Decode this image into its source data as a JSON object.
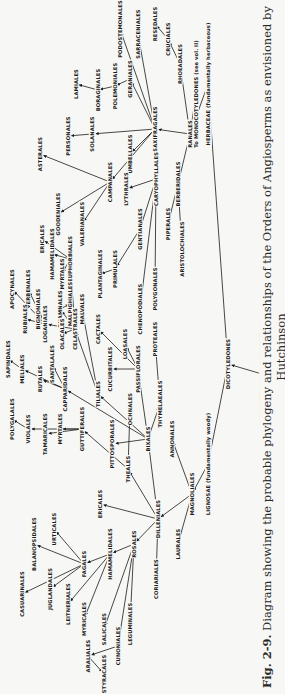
{
  "figure": {
    "number": "Fig. 2-9.",
    "caption": "Diagram showing the probable phylogeny and relationships of the Orders of Angiosperms as envisioned by Hutchinson"
  },
  "nodes": [
    {
      "id": "hypothetical_proangiosperms",
      "label": "HYPOTHETICAL PROANGIOSPERMS",
      "x": 320,
      "y": 262
    },
    {
      "id": "dicotyledones",
      "label": "DICOTYLEDONES",
      "x": 330,
      "y": 228
    },
    {
      "id": "herbaceae",
      "label": "HERBACEAE (fundamentally herbaceous)",
      "x": 610,
      "y": 208
    },
    {
      "id": "lignosae",
      "label": "LIGNOSAE (fundamentally woody)",
      "x": 230,
      "y": 208
    },
    {
      "id": "monocotyledones",
      "label": "To MONOCOTYLEDONES (see vol. II)",
      "x": 600,
      "y": 196
    },
    {
      "id": "ranales",
      "label": "RANALES",
      "x": 560,
      "y": 190
    },
    {
      "id": "rhoeadales",
      "label": "RHOEADALES",
      "x": 630,
      "y": 180
    },
    {
      "id": "cruciales",
      "label": "CRUCIALES",
      "x": 655,
      "y": 168
    },
    {
      "id": "resedales",
      "label": "RESEDALES",
      "x": 670,
      "y": 155
    },
    {
      "id": "sarraceniales",
      "label": "SARRACENIALES",
      "x": 660,
      "y": 138
    },
    {
      "id": "podostemonales",
      "label": "PODOSTEMONALES",
      "x": 665,
      "y": 120
    },
    {
      "id": "saxifragales",
      "label": "SAXIFRAGALES",
      "x": 565,
      "y": 155
    },
    {
      "id": "geraniales",
      "label": "GERANIALES",
      "x": 615,
      "y": 130
    },
    {
      "id": "polemoniales",
      "label": "POLEMONIALES",
      "x": 608,
      "y": 115
    },
    {
      "id": "boraginales",
      "label": "BORAGINALES",
      "x": 604,
      "y": 98
    },
    {
      "id": "lamiales",
      "label": "LAMIALES",
      "x": 610,
      "y": 76
    },
    {
      "id": "solanales",
      "label": "SOLANALES",
      "x": 560,
      "y": 92
    },
    {
      "id": "personales",
      "label": "PERSONALES",
      "x": 558,
      "y": 68
    },
    {
      "id": "umbellales",
      "label": "UMBELLALES",
      "x": 540,
      "y": 130
    },
    {
      "id": "caryophyllales",
      "label": "CARYOPHYLLALES",
      "x": 515,
      "y": 156
    },
    {
      "id": "berberidales",
      "label": "BERBERIDALES",
      "x": 510,
      "y": 178
    },
    {
      "id": "campanales",
      "label": "CAMPANALES",
      "x": 512,
      "y": 110
    },
    {
      "id": "asterales",
      "label": "ASTERALES",
      "x": 540,
      "y": 40
    },
    {
      "id": "goodeniales",
      "label": "GOODENIALES",
      "x": 480,
      "y": 58
    },
    {
      "id": "valerianales",
      "label": "VALERIANALES",
      "x": 470,
      "y": 82
    },
    {
      "id": "lythrales",
      "label": "LYTHRALES",
      "x": 505,
      "y": 126
    },
    {
      "id": "gentianales",
      "label": "GENTIANALES",
      "x": 465,
      "y": 140
    },
    {
      "id": "primulales",
      "label": "PRIMULALES",
      "x": 425,
      "y": 115
    },
    {
      "id": "plantaginales",
      "label": "PLANTAGINALES",
      "x": 420,
      "y": 100
    },
    {
      "id": "chenopodiales",
      "label": "CHENOPODIALES",
      "x": 385,
      "y": 140
    },
    {
      "id": "polygonales",
      "label": "POLYGONALES",
      "x": 405,
      "y": 155
    },
    {
      "id": "piperales",
      "label": "PIPERALES",
      "x": 470,
      "y": 168
    },
    {
      "id": "aristolochiales",
      "label": "ARISTOLOCHIALES",
      "x": 445,
      "y": 182
    },
    {
      "id": "ericales_top",
      "label": "ERICALES",
      "x": 455,
      "y": 42
    },
    {
      "id": "euphorbiales",
      "label": "EUPHORBIALES",
      "x": 435,
      "y": 70
    },
    {
      "id": "hydrangeales",
      "label": "HAMAMELIDALES",
      "x": 440,
      "y": 52
    },
    {
      "id": "myrtales_top",
      "label": "MYRTALES",
      "x": 420,
      "y": 62
    },
    {
      "id": "bignoniales",
      "label": "BIGNONIALES",
      "x": 385,
      "y": 38
    },
    {
      "id": "verbenales",
      "label": "VERBENALES",
      "x": 405,
      "y": 28
    },
    {
      "id": "apocynales",
      "label": "APOCYNALES",
      "x": 405,
      "y": 12
    },
    {
      "id": "loganiales",
      "label": "LOGANIALES",
      "x": 370,
      "y": 45
    },
    {
      "id": "rhamnales",
      "label": "RHAMNALES",
      "x": 385,
      "y": 60
    },
    {
      "id": "malpighiales",
      "label": "MALPIGHIALES",
      "x": 390,
      "y": 70
    },
    {
      "id": "malvales",
      "label": "MALVALES",
      "x": 385,
      "y": 82
    },
    {
      "id": "rubiales",
      "label": "RUBIALES",
      "x": 375,
      "y": 25
    },
    {
      "id": "olacales",
      "label": "OLACALES",
      "x": 360,
      "y": 62
    },
    {
      "id": "celastrales",
      "label": "CELASTRALES",
      "x": 365,
      "y": 75
    },
    {
      "id": "cactales",
      "label": "CACTALES",
      "x": 365,
      "y": 98
    },
    {
      "id": "loasales",
      "label": "LOASALES",
      "x": 350,
      "y": 125
    },
    {
      "id": "proteales",
      "label": "PROTEALES",
      "x": 355,
      "y": 155
    },
    {
      "id": "cucurbitales",
      "label": "CUCURBITALES",
      "x": 325,
      "y": 110
    },
    {
      "id": "passiflorales",
      "label": "PASSIFLORALES",
      "x": 325,
      "y": 138
    },
    {
      "id": "thymelaeales",
      "label": "THYMELAEALES",
      "x": 290,
      "y": 160
    },
    {
      "id": "sapindales",
      "label": "SAPINDALES",
      "x": 335,
      "y": 8
    },
    {
      "id": "meliales",
      "label": "MELIALES",
      "x": 325,
      "y": 22
    },
    {
      "id": "rutales",
      "label": "RUTALES",
      "x": 315,
      "y": 40
    },
    {
      "id": "santalales",
      "label": "SANTALALES",
      "x": 330,
      "y": 52
    },
    {
      "id": "capparidales",
      "label": "CAPPARIDALES",
      "x": 305,
      "y": 65
    },
    {
      "id": "tiliales",
      "label": "TILIALES",
      "x": 300,
      "y": 98
    },
    {
      "id": "polygalales",
      "label": "POLYGALALES",
      "x": 275,
      "y": 12
    },
    {
      "id": "violales",
      "label": "VIOLALES",
      "x": 265,
      "y": 28
    },
    {
      "id": "tamaricales",
      "label": "TAMARICALES",
      "x": 260,
      "y": 45
    },
    {
      "id": "myrtales",
      "label": "MYRTALES",
      "x": 265,
      "y": 60
    },
    {
      "id": "guttiferales",
      "label": "GUTTIFERALES",
      "x": 265,
      "y": 82
    },
    {
      "id": "pittosporales",
      "label": "PITTOSPORALES",
      "x": 250,
      "y": 112
    },
    {
      "id": "ochnales",
      "label": "OCHNALES",
      "x": 285,
      "y": 130
    },
    {
      "id": "theales",
      "label": "THEALES",
      "x": 225,
      "y": 128
    },
    {
      "id": "bixales",
      "label": "BIXALES",
      "x": 255,
      "y": 148
    },
    {
      "id": "annonales",
      "label": "ANNONALES",
      "x": 255,
      "y": 172
    },
    {
      "id": "magnoliales",
      "label": "MAGNOLIALES",
      "x": 200,
      "y": 192
    },
    {
      "id": "ericales",
      "label": "ERICALES",
      "x": 190,
      "y": 100
    },
    {
      "id": "dilleniales",
      "label": "DILLENIALES",
      "x": 175,
      "y": 158
    },
    {
      "id": "laurales",
      "label": "LAURALES",
      "x": 150,
      "y": 178
    },
    {
      "id": "rosales",
      "label": "ROSALES",
      "x": 150,
      "y": 134
    },
    {
      "id": "coriariales",
      "label": "CORIARIALES",
      "x": 115,
      "y": 156
    },
    {
      "id": "hamamelidales",
      "label": "HAMAMELIDALES",
      "x": 140,
      "y": 110
    },
    {
      "id": "fagales",
      "label": "FAGALES",
      "x": 130,
      "y": 84
    },
    {
      "id": "urticales",
      "label": "URTICALES",
      "x": 165,
      "y": 54
    },
    {
      "id": "balanopsidales",
      "label": "BALANOPSIDALES",
      "x": 150,
      "y": 34
    },
    {
      "id": "casuarinales",
      "label": "CASUARINALES",
      "x": 100,
      "y": 22
    },
    {
      "id": "juglandales",
      "label": "JUGLANDALES",
      "x": 105,
      "y": 50
    },
    {
      "id": "leitneriales",
      "label": "LEITNERIALES",
      "x": 90,
      "y": 68
    },
    {
      "id": "myricales",
      "label": "MYRICALES",
      "x": 75,
      "y": 84
    },
    {
      "id": "salicales",
      "label": "SALICALES",
      "x": 65,
      "y": 104
    },
    {
      "id": "leguminales",
      "label": "LEGUMINALES",
      "x": 70,
      "y": 130
    },
    {
      "id": "cunoniales",
      "label": "CUNONIALES",
      "x": 48,
      "y": 118
    },
    {
      "id": "araliales",
      "label": "ARALIALES",
      "x": 38,
      "y": 88
    },
    {
      "id": "styracales",
      "label": "STYRACALES",
      "x": 20,
      "y": 104
    }
  ],
  "edges": [
    [
      "hypothetical_proangiosperms",
      "dicotyledones"
    ],
    [
      "dicotyledones",
      "herbaceae"
    ],
    [
      "dicotyledones",
      "lignosae"
    ],
    [
      "herbaceae",
      "ranales"
    ],
    [
      "ranales",
      "monocotyledones"
    ],
    [
      "ranales",
      "rhoeadales"
    ],
    [
      "rhoeadales",
      "cruciales"
    ],
    [
      "cruciales",
      "resedales"
    ],
    [
      "ranales",
      "saxifragales"
    ],
    [
      "ranales",
      "berberidales"
    ],
    [
      "saxifragales",
      "sarraceniales"
    ],
    [
      "saxifragales",
      "podostemonales"
    ],
    [
      "saxifragales",
      "geraniales"
    ],
    [
      "geraniales",
      "polemoniales"
    ],
    [
      "polemoniales",
      "boraginales"
    ],
    [
      "boraginales",
      "lamiales"
    ],
    [
      "saxifragales",
      "solanales"
    ],
    [
      "solanales",
      "personales"
    ],
    [
      "saxifragales",
      "umbellales"
    ],
    [
      "saxifragales",
      "caryophyllales"
    ],
    [
      "saxifragales",
      "campanales"
    ],
    [
      "campanales",
      "asterales"
    ],
    [
      "campanales",
      "goodeniales"
    ],
    [
      "campanales",
      "valerianales"
    ],
    [
      "caryophyllales",
      "lythrales"
    ],
    [
      "caryophyllales",
      "gentianales"
    ],
    [
      "caryophyllales",
      "chenopodiales"
    ],
    [
      "caryophyllales",
      "polygonales"
    ],
    [
      "gentianales",
      "primulales"
    ],
    [
      "primulales",
      "plantaginales"
    ],
    [
      "berberidales",
      "piperales"
    ],
    [
      "berberidales",
      "aristolochiales"
    ],
    [
      "lignosae",
      "magnoliales"
    ],
    [
      "magnoliales",
      "annonales"
    ],
    [
      "magnoliales",
      "laurales"
    ],
    [
      "magnoliales",
      "dilleniales"
    ],
    [
      "dilleniales",
      "coriariales"
    ],
    [
      "dilleniales",
      "bixales"
    ],
    [
      "dilleniales",
      "theales"
    ],
    [
      "dilleniales",
      "ericales"
    ],
    [
      "dilleniales",
      "rosales"
    ],
    [
      "rosales",
      "hamamelidales"
    ],
    [
      "rosales",
      "leguminales"
    ],
    [
      "rosales",
      "cunoniales"
    ],
    [
      "rosales",
      "salicales"
    ],
    [
      "hamamelidales",
      "fagales"
    ],
    [
      "fagales",
      "urticales"
    ],
    [
      "fagales",
      "balanopsidales"
    ],
    [
      "fagales",
      "casuarinales"
    ],
    [
      "fagales",
      "juglandales"
    ],
    [
      "hamamelidales",
      "leitneriales"
    ],
    [
      "hamamelidales",
      "myricales"
    ],
    [
      "cunoniales",
      "araliales"
    ],
    [
      "araliales",
      "styracales"
    ],
    [
      "bixales",
      "pittosporales"
    ],
    [
      "bixales",
      "passiflorales"
    ],
    [
      "bixales",
      "tiliales"
    ],
    [
      "bixales",
      "thymelaeales"
    ],
    [
      "bixales",
      "capparidales"
    ],
    [
      "theales",
      "ochnales"
    ],
    [
      "theales",
      "guttiferales"
    ],
    [
      "thymelaeales",
      "proteales"
    ],
    [
      "passiflorales",
      "cucurbitales"
    ],
    [
      "passiflorales",
      "cactales"
    ],
    [
      "passiflorales",
      "loasales"
    ],
    [
      "tiliales",
      "malvales"
    ],
    [
      "tiliales",
      "celastrales"
    ],
    [
      "celastrales",
      "olacales"
    ],
    [
      "celastrales",
      "loganiales"
    ],
    [
      "celastrales",
      "rhamnales"
    ],
    [
      "celastrales",
      "euphorbiales"
    ],
    [
      "rhamnales",
      "malpighiales"
    ],
    [
      "euphorbiales",
      "hydrangeales"
    ],
    [
      "euphorbiales",
      "ericales_top"
    ],
    [
      "euphorbiales",
      "myrtales_top"
    ],
    [
      "loganiales",
      "rubiales"
    ],
    [
      "loganiales",
      "apocynales"
    ],
    [
      "loganiales",
      "verbenales"
    ],
    [
      "loganiales",
      "bignoniales"
    ],
    [
      "capparidales",
      "santalales"
    ],
    [
      "capparidales",
      "rutales"
    ],
    [
      "capparidales",
      "meliales"
    ],
    [
      "meliales",
      "sapindales"
    ],
    [
      "guttiferales",
      "myrtales"
    ],
    [
      "guttiferales",
      "tamaricales"
    ],
    [
      "guttiferales",
      "violales"
    ],
    [
      "violales",
      "polygalales"
    ]
  ]
}
